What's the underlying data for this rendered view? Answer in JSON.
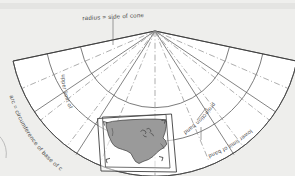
{
  "figure": {
    "background_color": "#f4f4f2",
    "ink_color": "#555555",
    "map_fill_color": "#9a9a9a",
    "top_band_color": "#e3e3e1",
    "labels": {
      "radius": "radius = side of cone",
      "arc": "arc = circumference of base of cone",
      "upper_limit": "upper limit of",
      "projection_band": "projection band",
      "lower_limit": "lower limit of band"
    },
    "geometry": {
      "apex_x": 155,
      "apex_y": 31,
      "outer_radius": 145,
      "middle_radius": 110,
      "inner_radius": 76,
      "band_inner_radius": 76,
      "start_angle_deg": 12,
      "end_angle_deg": 168,
      "radial_dividers": 5,
      "dash_dot_rays": 9
    },
    "map_label": "united-states-outline"
  }
}
